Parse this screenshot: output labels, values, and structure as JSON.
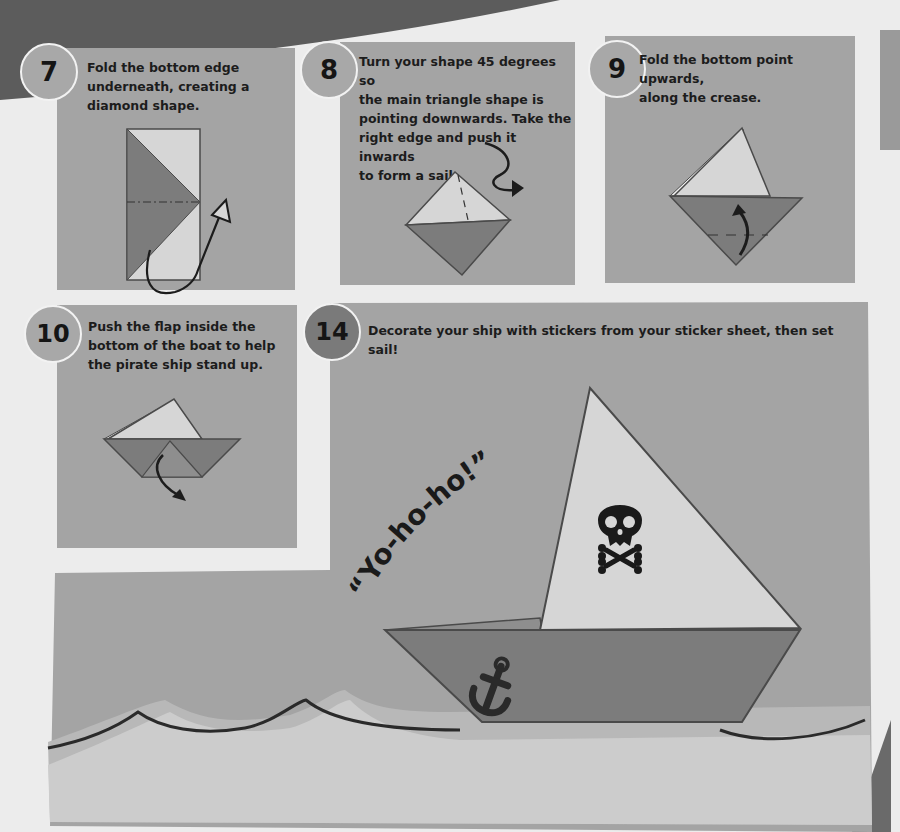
{
  "page": {
    "style": "grayscale scan of origami instruction page",
    "colors": {
      "background": "#ececec",
      "panel": "#a4a4a4",
      "wedge": "#5c5c5c",
      "paper_light": "#d6d6d6",
      "paper_dark": "#7c7c7c",
      "outline": "#4a4a4a",
      "ink": "#1c1c1c"
    }
  },
  "steps": [
    {
      "number": "7",
      "text": "Fold the bottom edge underneath, creating a diamond shape.",
      "lines": [
        "Fold the bottom edge",
        "underneath, creating a",
        "diamond shape."
      ]
    },
    {
      "number": "8",
      "text": "Turn your shape 45 degrees so the main triangle shape is pointing downwards. Take the right edge and push it inwards to form a sail.",
      "lines": [
        "Turn your shape 45 degrees so",
        "the main triangle shape is",
        "pointing downwards. Take the",
        "right edge and push it inwards",
        "to form a sail."
      ]
    },
    {
      "number": "9",
      "text": "Fold the bottom point upwards, along the crease.",
      "lines": [
        "Fold the bottom point upwards,",
        "along the crease."
      ]
    },
    {
      "number": "10",
      "text": "Push the flap inside the bottom of the boat to help the pirate ship stand up.",
      "lines": [
        "Push the flap inside the",
        "bottom of the boat to help",
        "the pirate ship stand up."
      ]
    },
    {
      "number": "14",
      "text": "Decorate your ship with stickers from your sticker sheet, then set sail!",
      "lines": [
        "Decorate your ship with stickers from your sticker sheet, then set sail!"
      ]
    }
  ],
  "illustration": {
    "speech": "“Yo-ho-ho!”",
    "sail_icon": "skull-and-crossbones",
    "hull_icon": "anchor"
  }
}
